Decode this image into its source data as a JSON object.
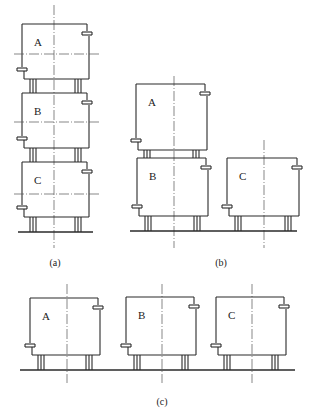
{
  "colors": {
    "line": "#2a2a2a",
    "axis": "#555555",
    "background": "#ffffff"
  },
  "panels": [
    {
      "id": "a",
      "caption": "(a)",
      "caption_pos": [
        55,
        266
      ],
      "ground": {
        "x1": 18,
        "x2": 93,
        "y": 232
      },
      "axes_v": [
        {
          "x": 54,
          "y1": 5,
          "y2": 248
        }
      ],
      "modules": [
        {
          "label": "A",
          "x": 22,
          "y": 24,
          "w": 67,
          "h": 55,
          "hline": 54,
          "leg_h": 14
        },
        {
          "label": "B",
          "x": 22,
          "y": 93,
          "w": 67,
          "h": 55,
          "hline": 122,
          "leg_h": 14
        },
        {
          "label": "C",
          "x": 22,
          "y": 162,
          "w": 67,
          "h": 55,
          "hline": 194,
          "leg_h": 15
        }
      ]
    },
    {
      "id": "b",
      "caption": "(b)",
      "caption_pos": [
        221,
        266
      ],
      "ground": {
        "x1": 130,
        "x2": 297,
        "y": 231
      },
      "axes_v": [
        {
          "x": 174,
          "y1": 76,
          "y2": 248
        },
        {
          "x": 264,
          "y1": 140,
          "y2": 248
        }
      ],
      "modules": [
        {
          "label": "A",
          "x": 136,
          "y": 84,
          "w": 71,
          "h": 66,
          "hline": null,
          "leg_h": 8
        },
        {
          "label": "B",
          "x": 137,
          "y": 158,
          "w": 71,
          "h": 58,
          "hline": null,
          "leg_h": 15
        },
        {
          "label": "C",
          "x": 227,
          "y": 158,
          "w": 72,
          "h": 58,
          "hline": null,
          "leg_h": 15
        }
      ]
    },
    {
      "id": "c",
      "caption": "(c)",
      "caption_pos": [
        162,
        405
      ],
      "ground": {
        "x1": 20,
        "x2": 295,
        "y": 370
      },
      "axes_v": [
        {
          "x": 67,
          "y1": 284,
          "y2": 383
        },
        {
          "x": 162,
          "y1": 284,
          "y2": 383
        },
        {
          "x": 252,
          "y1": 284,
          "y2": 383
        }
      ],
      "modules": [
        {
          "label": "A",
          "x": 30,
          "y": 298,
          "w": 70,
          "h": 57,
          "hline": null,
          "leg_h": 15
        },
        {
          "label": "B",
          "x": 126,
          "y": 297,
          "w": 70,
          "h": 58,
          "hline": null,
          "leg_h": 15
        },
        {
          "label": "C",
          "x": 216,
          "y": 297,
          "w": 70,
          "h": 58,
          "hline": null,
          "leg_h": 15
        }
      ]
    }
  ]
}
